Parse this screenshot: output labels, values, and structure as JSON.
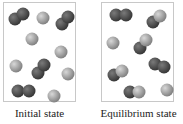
{
  "figure": {
    "panels": [
      {
        "id": "initial",
        "label": "Initial state",
        "box": {
          "x": 3,
          "y": 2,
          "w": 73,
          "h": 100
        },
        "atoms": [
          {
            "x": 11,
            "y": 16,
            "type": "dark"
          },
          {
            "x": 19,
            "y": 11,
            "type": "dark"
          },
          {
            "x": 39,
            "y": 15,
            "type": "light"
          },
          {
            "x": 58,
            "y": 21,
            "type": "dark"
          },
          {
            "x": 64,
            "y": 14,
            "type": "dark"
          },
          {
            "x": 28,
            "y": 36,
            "type": "light"
          },
          {
            "x": 57,
            "y": 49,
            "type": "light"
          },
          {
            "x": 12,
            "y": 63,
            "type": "light"
          },
          {
            "x": 34,
            "y": 70,
            "type": "dark"
          },
          {
            "x": 40,
            "y": 62,
            "type": "dark"
          },
          {
            "x": 64,
            "y": 71,
            "type": "light"
          },
          {
            "x": 14,
            "y": 88,
            "type": "dark"
          },
          {
            "x": 25,
            "y": 88,
            "type": "dark"
          },
          {
            "x": 50,
            "y": 93,
            "type": "light"
          }
        ]
      },
      {
        "id": "equilibrium",
        "label": "Equilibrium state",
        "box": {
          "x": 101,
          "y": 2,
          "w": 73,
          "h": 100
        },
        "atoms": [
          {
            "x": 14,
            "y": 12,
            "type": "dark"
          },
          {
            "x": 24,
            "y": 12,
            "type": "dark"
          },
          {
            "x": 51,
            "y": 19,
            "type": "dark"
          },
          {
            "x": 58,
            "y": 13,
            "type": "light"
          },
          {
            "x": 11,
            "y": 40,
            "type": "light"
          },
          {
            "x": 38,
            "y": 45,
            "type": "dark"
          },
          {
            "x": 44,
            "y": 37,
            "type": "light"
          },
          {
            "x": 53,
            "y": 61,
            "type": "dark"
          },
          {
            "x": 62,
            "y": 64,
            "type": "dark"
          },
          {
            "x": 12,
            "y": 72,
            "type": "dark"
          },
          {
            "x": 20,
            "y": 68,
            "type": "light"
          },
          {
            "x": 28,
            "y": 89,
            "type": "dark"
          },
          {
            "x": 37,
            "y": 89,
            "type": "light"
          },
          {
            "x": 65,
            "y": 87,
            "type": "light"
          }
        ]
      }
    ],
    "colors": {
      "dark": "#4a4a4a",
      "light": "#a8a8a8",
      "border": "#c8c8c8"
    }
  }
}
